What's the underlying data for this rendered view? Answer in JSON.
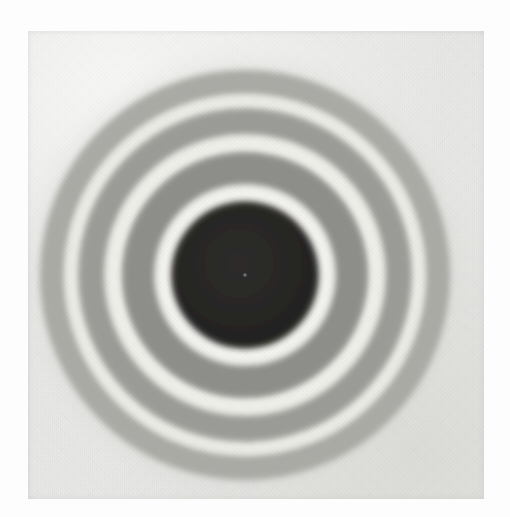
{
  "page": {
    "background_color": "#fdfdfd",
    "width": 510,
    "height": 517,
    "caption": ""
  },
  "plate": {
    "name": "diffraction-photograph",
    "description": "Scanned black and white photographic print of a concentric ring diffraction pattern",
    "x": 28,
    "y": 31,
    "width": 456,
    "height": 468,
    "background_color": "#e9e9e7",
    "border_color": "#d9d9d5"
  },
  "pattern": {
    "center_x": 217,
    "center_y": 244,
    "type": "concentric-rings",
    "ring_count": 7,
    "core": {
      "label": "central dark disk",
      "radius": 73,
      "color": "#262524",
      "edge_softness": 3
    },
    "rings": [
      {
        "label": "bright ring 1",
        "inner_radius": 73,
        "outer_radius": 90,
        "color": "#f2f2ee",
        "kind": "bright"
      },
      {
        "label": "dark ring 1",
        "inner_radius": 90,
        "outer_radius": 122,
        "color": "#8e8e8a",
        "kind": "dark"
      },
      {
        "label": "bright ring 2",
        "inner_radius": 122,
        "outer_radius": 140,
        "color": "#efefea",
        "kind": "bright"
      },
      {
        "label": "dark ring 2",
        "inner_radius": 140,
        "outer_radius": 166,
        "color": "#9b9b97",
        "kind": "dark"
      },
      {
        "label": "bright ring 3",
        "inner_radius": 166,
        "outer_radius": 180,
        "color": "#ececE6",
        "kind": "bright"
      },
      {
        "label": "dark ring 3",
        "inner_radius": 180,
        "outer_radius": 205,
        "color": "#ababa6",
        "kind": "dark"
      },
      {
        "label": "halo fade",
        "inner_radius": 205,
        "outer_radius": 232,
        "color": "#d6d6d2",
        "kind": "fade"
      }
    ],
    "colors": {
      "core": "#262524",
      "bright": "#f2f2ee",
      "mid_gray": "#9b9b97",
      "outer_gray": "#ababa6",
      "background": "#e9e9e7"
    }
  },
  "chart_data": {
    "type": "line",
    "xlabel": "Radius (px from pattern centre)",
    "ylabel": "Relative brightness (0 = black, 255 = white)",
    "x": [
      0,
      20,
      40,
      60,
      73,
      82,
      90,
      105,
      122,
      131,
      140,
      153,
      166,
      173,
      180,
      193,
      205,
      218,
      232,
      250
    ],
    "values": [
      38,
      38,
      38,
      40,
      48,
      242,
      170,
      142,
      150,
      239,
      168,
      155,
      160,
      236,
      186,
      171,
      176,
      205,
      222,
      233
    ],
    "ylim": [
      0,
      255
    ],
    "grid": false,
    "legend": "none"
  }
}
